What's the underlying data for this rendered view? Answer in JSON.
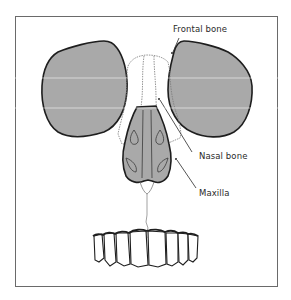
{
  "diagram": {
    "type": "anatomical-illustration",
    "labels": [
      {
        "id": "frontal",
        "text": "Frontal bone"
      },
      {
        "id": "nasal",
        "text": "Nasal bone"
      },
      {
        "id": "maxilla",
        "text": "Maxilla"
      }
    ],
    "colors": {
      "bone_fill": "#a9a9a9",
      "outline": "#1e1e1e",
      "suture_line": "#7a7a7a",
      "frame": "#6a6a6a",
      "background": "#ffffff"
    }
  }
}
